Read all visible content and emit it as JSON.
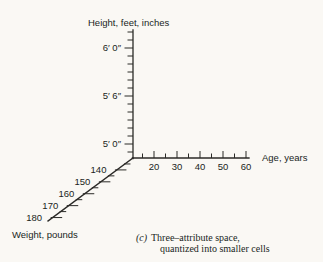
{
  "figure": {
    "ink_color": "#2b2a27",
    "paper_color": "#faf8f4",
    "axes": {
      "height": {
        "title": "Height, feet, inches",
        "tick_labels": [
          "6′ 0″",
          "5′ 6″",
          "5′ 0″"
        ]
      },
      "age": {
        "title": "Age, years",
        "tick_labels": [
          "20",
          "30",
          "40",
          "50",
          "60"
        ]
      },
      "weight": {
        "title": "Weight, pounds",
        "tick_labels": [
          "140",
          "150",
          "160",
          "170",
          "180"
        ]
      }
    },
    "caption": {
      "label": "(c)",
      "line1": "Three–attribute space,",
      "line2": "quantized into smaller cells"
    }
  }
}
